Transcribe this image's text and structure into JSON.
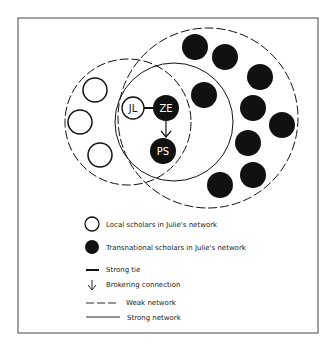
{
  "figure": {
    "frame": {
      "x": 18,
      "y": 18,
      "width": 300,
      "height": 315,
      "stroke": "#444444"
    },
    "networks": [
      {
        "id": "local-weak-network",
        "type": "weak",
        "cx": 128,
        "cy": 122,
        "r": 63
      },
      {
        "id": "transnational-weak-network",
        "type": "weak",
        "cx": 208,
        "cy": 118,
        "r": 90
      },
      {
        "id": "strong-network",
        "type": "strong",
        "cx": 174,
        "cy": 122,
        "r": 59
      }
    ],
    "named_nodes": [
      {
        "id": "JL",
        "label": "JL",
        "kind": "local",
        "cx": 133,
        "cy": 108,
        "r": 11
      },
      {
        "id": "ZE",
        "label": "ZE",
        "kind": "transnational",
        "cx": 166,
        "cy": 108,
        "r": 13
      },
      {
        "id": "PS",
        "label": "PS",
        "kind": "transnational",
        "cx": 163,
        "cy": 151,
        "r": 13
      }
    ],
    "local_nodes": [
      {
        "cx": 95,
        "cy": 90,
        "r": 12
      },
      {
        "cx": 80,
        "cy": 122,
        "r": 12
      },
      {
        "cx": 100,
        "cy": 155,
        "r": 12
      }
    ],
    "transnational_nodes": [
      {
        "cx": 195,
        "cy": 47,
        "r": 13
      },
      {
        "cx": 225,
        "cy": 57,
        "r": 13
      },
      {
        "cx": 260,
        "cy": 77,
        "r": 13
      },
      {
        "cx": 204,
        "cy": 95,
        "r": 13
      },
      {
        "cx": 253,
        "cy": 108,
        "r": 13
      },
      {
        "cx": 282,
        "cy": 125,
        "r": 13
      },
      {
        "cx": 248,
        "cy": 143,
        "r": 13
      },
      {
        "cx": 253,
        "cy": 175,
        "r": 13
      },
      {
        "cx": 220,
        "cy": 185,
        "r": 13
      }
    ],
    "edges": [
      {
        "from": "JL",
        "to": "ZE",
        "type": "strong-tie"
      },
      {
        "from": "ZE",
        "to": "PS",
        "type": "brokering-connection"
      }
    ],
    "legend": {
      "items": [
        {
          "symbol": "open-circle",
          "label": "Local scholars in Julie's network"
        },
        {
          "symbol": "filled-circle",
          "label": "Transnational scholars in Julie's network"
        },
        {
          "symbol": "thick-line",
          "label": "Strong tie"
        },
        {
          "symbol": "down-arrow",
          "label": "Brokering connection"
        },
        {
          "symbol": "dashed-line",
          "label": "Weak network"
        },
        {
          "symbol": "solid-line",
          "label": "Strong network"
        }
      ]
    },
    "colors": {
      "ink": "#111111",
      "paper": "#ffffff"
    }
  }
}
